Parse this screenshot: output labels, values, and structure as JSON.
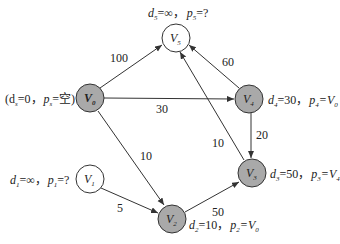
{
  "diagram": {
    "type": "weighted directed graph (Dijkstra shortest path state)",
    "colors": {
      "visited_fill": "#a9a9a9",
      "unvisited_fill": "#ffffff",
      "stroke": "#333333",
      "edge": "#333333",
      "text": "#222222"
    },
    "nodes": [
      {
        "id": "V0",
        "name": "V",
        "sub": "0",
        "x": 90,
        "y": 98,
        "visited": true,
        "annotation": {
          "text": "(d",
          "d_sub": "s",
          "d_val": "=0，",
          "p": "p",
          "p_sub": "s",
          "p_val": "=空)"
        }
      },
      {
        "id": "V1",
        "name": "V",
        "sub": "1",
        "x": 90,
        "y": 179,
        "visited": false,
        "annotation": {
          "text": "d",
          "d_sub": "1",
          "d_val": "=∞，",
          "p": "p",
          "p_sub": "1",
          "p_val": "=?"
        }
      },
      {
        "id": "V2",
        "name": "V",
        "sub": "2",
        "x": 172,
        "y": 219,
        "visited": true,
        "annotation": {
          "text": "d",
          "d_sub": "2",
          "d_val": "=10，",
          "p": "p",
          "p_sub": "2",
          "p_val": "=V",
          "p_val_sub": "0"
        }
      },
      {
        "id": "V3",
        "name": "V",
        "sub": "3",
        "x": 252,
        "y": 173,
        "visited": true,
        "annotation": {
          "text": "d",
          "d_sub": "3",
          "d_val": "=50，",
          "p": "p",
          "p_sub": "3",
          "p_val": "=V",
          "p_val_sub": "4"
        }
      },
      {
        "id": "V4",
        "name": "V",
        "sub": "4",
        "x": 249,
        "y": 99,
        "visited": true,
        "annotation": {
          "text": "d",
          "d_sub": "4",
          "d_val": "=30，",
          "p": "p",
          "p_sub": "4",
          "p_val": "=V",
          "p_val_sub": "0"
        }
      },
      {
        "id": "V5",
        "name": "V",
        "sub": "5",
        "x": 176,
        "y": 38,
        "visited": false,
        "annotation": {
          "text": "d",
          "d_sub": "5",
          "d_val": "=∞，",
          "p": "p",
          "p_sub": "5",
          "p_val": "=?"
        }
      }
    ],
    "edges": [
      {
        "from": "V0",
        "to": "V5",
        "weight": "100"
      },
      {
        "from": "V0",
        "to": "V4",
        "weight": "30"
      },
      {
        "from": "V0",
        "to": "V2",
        "weight": "10"
      },
      {
        "from": "V4",
        "to": "V5",
        "weight": "60"
      },
      {
        "from": "V4",
        "to": "V3",
        "weight": "20"
      },
      {
        "from": "V3",
        "to": "V5",
        "weight": "10"
      },
      {
        "from": "V1",
        "to": "V2",
        "weight": "5"
      },
      {
        "from": "V2",
        "to": "V3",
        "weight": "50"
      }
    ]
  }
}
